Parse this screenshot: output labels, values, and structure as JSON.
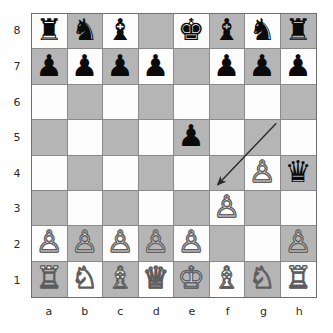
{
  "diagram": {
    "type": "chessboard",
    "orientation": "white-bottom",
    "colors": {
      "light_square": "#fdfdfd",
      "dark_square": "#b5b5b5",
      "board_border": "#6e6e6e",
      "grid_line": "#8a8a8a",
      "black_piece": "#0b0b0b",
      "white_piece_fill": "#ffffff",
      "white_piece_outline": "#5c5c5c",
      "arrow": "#2a2a2a",
      "label_text": "#2a2a2a",
      "page_background": "#ffffff"
    },
    "rank_labels": [
      "8",
      "7",
      "6",
      "5",
      "4",
      "3",
      "2",
      "1"
    ],
    "file_labels": [
      "a",
      "b",
      "c",
      "d",
      "e",
      "f",
      "g",
      "h"
    ],
    "position_fen": "rnb1kbnr/pppp1ppp/8/4p3/6Pq/5P2/PPPPP2P/RNBQKBNR",
    "ranks": [
      {
        "rank": "8",
        "squares": [
          {
            "square": "a8",
            "shade": "light",
            "piece": "black-rook",
            "glyph": "♜",
            "color": "black"
          },
          {
            "square": "b8",
            "shade": "dark",
            "piece": "black-knight",
            "glyph": "♞",
            "color": "black"
          },
          {
            "square": "c8",
            "shade": "light",
            "piece": "black-bishop",
            "glyph": "♝",
            "color": "black"
          },
          {
            "square": "d8",
            "shade": "dark",
            "piece": null,
            "glyph": "",
            "color": ""
          },
          {
            "square": "e8",
            "shade": "light",
            "piece": "black-king",
            "glyph": "♚",
            "color": "black"
          },
          {
            "square": "f8",
            "shade": "dark",
            "piece": "black-bishop",
            "glyph": "♝",
            "color": "black"
          },
          {
            "square": "g8",
            "shade": "light",
            "piece": "black-knight",
            "glyph": "♞",
            "color": "black"
          },
          {
            "square": "h8",
            "shade": "dark",
            "piece": "black-rook",
            "glyph": "♜",
            "color": "black"
          }
        ]
      },
      {
        "rank": "7",
        "squares": [
          {
            "square": "a7",
            "shade": "dark",
            "piece": "black-pawn",
            "glyph": "♟",
            "color": "black"
          },
          {
            "square": "b7",
            "shade": "light",
            "piece": "black-pawn",
            "glyph": "♟",
            "color": "black"
          },
          {
            "square": "c7",
            "shade": "dark",
            "piece": "black-pawn",
            "glyph": "♟",
            "color": "black"
          },
          {
            "square": "d7",
            "shade": "light",
            "piece": "black-pawn",
            "glyph": "♟",
            "color": "black"
          },
          {
            "square": "e7",
            "shade": "dark",
            "piece": null,
            "glyph": "",
            "color": ""
          },
          {
            "square": "f7",
            "shade": "light",
            "piece": "black-pawn",
            "glyph": "♟",
            "color": "black"
          },
          {
            "square": "g7",
            "shade": "dark",
            "piece": "black-pawn",
            "glyph": "♟",
            "color": "black"
          },
          {
            "square": "h7",
            "shade": "light",
            "piece": "black-pawn",
            "glyph": "♟",
            "color": "black"
          }
        ]
      },
      {
        "rank": "6",
        "squares": [
          {
            "square": "a6",
            "shade": "light",
            "piece": null,
            "glyph": "",
            "color": ""
          },
          {
            "square": "b6",
            "shade": "dark",
            "piece": null,
            "glyph": "",
            "color": ""
          },
          {
            "square": "c6",
            "shade": "light",
            "piece": null,
            "glyph": "",
            "color": ""
          },
          {
            "square": "d6",
            "shade": "dark",
            "piece": null,
            "glyph": "",
            "color": ""
          },
          {
            "square": "e6",
            "shade": "light",
            "piece": null,
            "glyph": "",
            "color": ""
          },
          {
            "square": "f6",
            "shade": "dark",
            "piece": null,
            "glyph": "",
            "color": ""
          },
          {
            "square": "g6",
            "shade": "light",
            "piece": null,
            "glyph": "",
            "color": ""
          },
          {
            "square": "h6",
            "shade": "dark",
            "piece": null,
            "glyph": "",
            "color": ""
          }
        ]
      },
      {
        "rank": "5",
        "squares": [
          {
            "square": "a5",
            "shade": "dark",
            "piece": null,
            "glyph": "",
            "color": ""
          },
          {
            "square": "b5",
            "shade": "light",
            "piece": null,
            "glyph": "",
            "color": ""
          },
          {
            "square": "c5",
            "shade": "dark",
            "piece": null,
            "glyph": "",
            "color": ""
          },
          {
            "square": "d5",
            "shade": "light",
            "piece": null,
            "glyph": "",
            "color": ""
          },
          {
            "square": "e5",
            "shade": "dark",
            "piece": "black-pawn",
            "glyph": "♟",
            "color": "black"
          },
          {
            "square": "f5",
            "shade": "light",
            "piece": null,
            "glyph": "",
            "color": ""
          },
          {
            "square": "g5",
            "shade": "dark",
            "piece": null,
            "glyph": "",
            "color": ""
          },
          {
            "square": "h5",
            "shade": "light",
            "piece": null,
            "glyph": "",
            "color": ""
          }
        ]
      },
      {
        "rank": "4",
        "squares": [
          {
            "square": "a4",
            "shade": "light",
            "piece": null,
            "glyph": "",
            "color": ""
          },
          {
            "square": "b4",
            "shade": "dark",
            "piece": null,
            "glyph": "",
            "color": ""
          },
          {
            "square": "c4",
            "shade": "light",
            "piece": null,
            "glyph": "",
            "color": ""
          },
          {
            "square": "d4",
            "shade": "dark",
            "piece": null,
            "glyph": "",
            "color": ""
          },
          {
            "square": "e4",
            "shade": "light",
            "piece": null,
            "glyph": "",
            "color": ""
          },
          {
            "square": "f4",
            "shade": "dark",
            "piece": null,
            "glyph": "",
            "color": ""
          },
          {
            "square": "g4",
            "shade": "light",
            "piece": "white-pawn",
            "glyph": "♙",
            "color": "white"
          },
          {
            "square": "h4",
            "shade": "dark",
            "piece": "black-queen",
            "glyph": "♛",
            "color": "black"
          }
        ]
      },
      {
        "rank": "3",
        "squares": [
          {
            "square": "a3",
            "shade": "dark",
            "piece": null,
            "glyph": "",
            "color": ""
          },
          {
            "square": "b3",
            "shade": "light",
            "piece": null,
            "glyph": "",
            "color": ""
          },
          {
            "square": "c3",
            "shade": "dark",
            "piece": null,
            "glyph": "",
            "color": ""
          },
          {
            "square": "d3",
            "shade": "light",
            "piece": null,
            "glyph": "",
            "color": ""
          },
          {
            "square": "e3",
            "shade": "dark",
            "piece": null,
            "glyph": "",
            "color": ""
          },
          {
            "square": "f3",
            "shade": "light",
            "piece": "white-pawn",
            "glyph": "♙",
            "color": "white"
          },
          {
            "square": "g3",
            "shade": "dark",
            "piece": null,
            "glyph": "",
            "color": ""
          },
          {
            "square": "h3",
            "shade": "light",
            "piece": null,
            "glyph": "",
            "color": ""
          }
        ]
      },
      {
        "rank": "2",
        "squares": [
          {
            "square": "a2",
            "shade": "light",
            "piece": "white-pawn",
            "glyph": "♙",
            "color": "white"
          },
          {
            "square": "b2",
            "shade": "dark",
            "piece": "white-pawn",
            "glyph": "♙",
            "color": "white"
          },
          {
            "square": "c2",
            "shade": "light",
            "piece": "white-pawn",
            "glyph": "♙",
            "color": "white"
          },
          {
            "square": "d2",
            "shade": "dark",
            "piece": "white-pawn",
            "glyph": "♙",
            "color": "white"
          },
          {
            "square": "e2",
            "shade": "light",
            "piece": "white-pawn",
            "glyph": "♙",
            "color": "white"
          },
          {
            "square": "f2",
            "shade": "dark",
            "piece": null,
            "glyph": "",
            "color": ""
          },
          {
            "square": "g2",
            "shade": "light",
            "piece": null,
            "glyph": "",
            "color": ""
          },
          {
            "square": "h2",
            "shade": "dark",
            "piece": "white-pawn",
            "glyph": "♙",
            "color": "white"
          }
        ]
      },
      {
        "rank": "1",
        "squares": [
          {
            "square": "a1",
            "shade": "dark",
            "piece": "white-rook",
            "glyph": "♖",
            "color": "white"
          },
          {
            "square": "b1",
            "shade": "light",
            "piece": "white-knight",
            "glyph": "♘",
            "color": "white"
          },
          {
            "square": "c1",
            "shade": "dark",
            "piece": "white-bishop",
            "glyph": "♗",
            "color": "white"
          },
          {
            "square": "d1",
            "shade": "light",
            "piece": "white-queen",
            "glyph": "♕",
            "color": "white"
          },
          {
            "square": "e1",
            "shade": "dark",
            "piece": "white-king",
            "glyph": "♔",
            "color": "white"
          },
          {
            "square": "f1",
            "shade": "light",
            "piece": "white-bishop",
            "glyph": "♗",
            "color": "white"
          },
          {
            "square": "g1",
            "shade": "dark",
            "piece": "white-knight",
            "glyph": "♘",
            "color": "white"
          },
          {
            "square": "h1",
            "shade": "light",
            "piece": "white-rook",
            "glyph": "♖",
            "color": "white"
          }
        ]
      }
    ],
    "arrow": {
      "name": "move-arrow",
      "from_square": "g4",
      "to_square": "f2",
      "from_point": {
        "x": 246,
        "y": 110
      },
      "to_point": {
        "x": 187,
        "y": 172
      },
      "color": "#2a2a2a",
      "width": 1.4,
      "head": "to_point"
    }
  }
}
